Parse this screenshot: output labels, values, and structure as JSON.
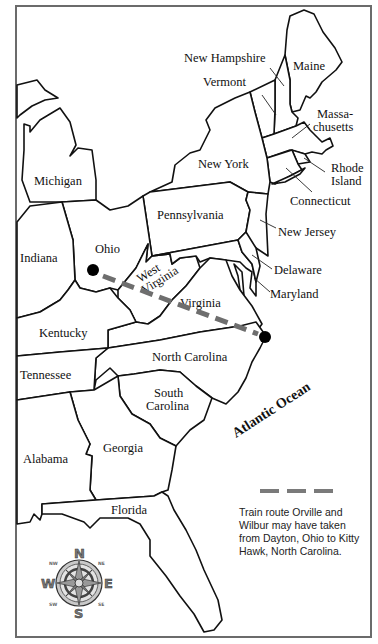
{
  "map": {
    "region": "Eastern United States",
    "states": [
      {
        "key": "maine",
        "label": "Maine"
      },
      {
        "key": "new_hampshire",
        "label": "New Hampshire"
      },
      {
        "key": "vermont",
        "label": "Vermont"
      },
      {
        "key": "massachusetts",
        "label_line1": "Massa-",
        "label_line2": "chusetts"
      },
      {
        "key": "rhode_island",
        "label_line1": "Rhode",
        "label_line2": "Island"
      },
      {
        "key": "connecticut",
        "label": "Connecticut"
      },
      {
        "key": "new_york",
        "label": "New York"
      },
      {
        "key": "michigan",
        "label": "Michigan"
      },
      {
        "key": "pennsylvania",
        "label": "Pennsylvania"
      },
      {
        "key": "new_jersey",
        "label": "New Jersey"
      },
      {
        "key": "ohio",
        "label": "Ohio"
      },
      {
        "key": "indiana",
        "label": "Indiana"
      },
      {
        "key": "west_virginia",
        "label_line1": "West",
        "label_line2": "Virginia"
      },
      {
        "key": "delaware",
        "label": "Delaware"
      },
      {
        "key": "maryland",
        "label": "Maryland"
      },
      {
        "key": "virginia",
        "label": "Virginia"
      },
      {
        "key": "kentucky",
        "label": "Kentucky"
      },
      {
        "key": "north_carolina",
        "label": "North Carolina"
      },
      {
        "key": "tennessee",
        "label": "Tennessee"
      },
      {
        "key": "south_carolina",
        "label_line1": "South",
        "label_line2": "Carolina"
      },
      {
        "key": "georgia",
        "label": "Georgia"
      },
      {
        "key": "alabama",
        "label": "Alabama"
      },
      {
        "key": "florida",
        "label": "Florida"
      }
    ],
    "water": {
      "ocean_label": "Atlantic Ocean"
    },
    "route": {
      "start": "Dayton, Ohio",
      "end": "Kitty Hawk, North Carolina",
      "color": "#6e6e6e"
    },
    "legend": {
      "text": "Train route Orville and Wilbur may have taken from Dayton, Ohio to Kitty Hawk, North Carolina."
    },
    "compass": {
      "n": "N",
      "s": "S",
      "e": "E",
      "w": "W",
      "ne": "NE",
      "nw": "NW",
      "se": "SE",
      "sw": "SW"
    }
  }
}
